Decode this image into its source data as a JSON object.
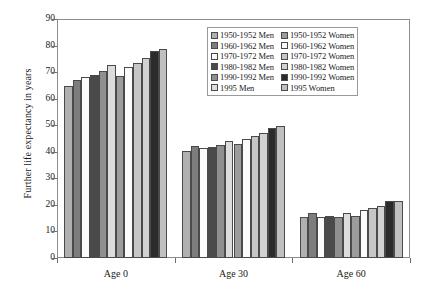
{
  "chart_data": {
    "type": "bar",
    "title": "",
    "subtitle": "",
    "xlabel": "",
    "ylabel": "Further life expectancy in years",
    "categories": [
      "Age 0",
      "Age 30",
      "Age 60"
    ],
    "ylim": [
      0,
      90
    ],
    "ytick_values": [
      0,
      10,
      20,
      30,
      40,
      50,
      60,
      70,
      80,
      90
    ],
    "ytick_labels": [
      "0",
      "10",
      "20",
      "30",
      "40",
      "50",
      "60",
      "70",
      "80",
      "90"
    ],
    "grid": false,
    "legend_position": "top-right inside plot",
    "series": [
      {
        "name": "1950-1952 Men",
        "color": "#b0b0b0",
        "values": [
          64.6,
          40.2,
          15.5
        ]
      },
      {
        "name": "1960-1962 Men",
        "color": "#7d7d7d",
        "values": [
          67.2,
          42.2,
          16.9
        ]
      },
      {
        "name": "1970-1972 Men",
        "color": "#fbfbfb",
        "values": [
          68.2,
          41.6,
          15.6
        ]
      },
      {
        "name": "1980-1982 Men",
        "color": "#4a4a4a",
        "values": [
          69.0,
          41.7,
          15.9
        ]
      },
      {
        "name": "1990-1992 Men",
        "color": "#8f8f8f",
        "values": [
          70.3,
          42.4,
          15.6
        ]
      },
      {
        "name": "1995 Men",
        "color": "#dcdcdc",
        "values": [
          72.5,
          44.0,
          17.1
        ]
      },
      {
        "name": "1950-1952 Women",
        "color": "#9c9c9c",
        "values": [
          68.5,
          42.9,
          16.0
        ]
      },
      {
        "name": "1960-1962 Women",
        "color": "#fbfbfb",
        "values": [
          71.8,
          44.7,
          18.2
        ]
      },
      {
        "name": "1970-1972 Women",
        "color": "#c6c6c6",
        "values": [
          73.6,
          45.8,
          18.8
        ]
      },
      {
        "name": "1980-1982 Women",
        "color": "#d2d2d2",
        "values": [
          75.3,
          46.9,
          19.5
        ]
      },
      {
        "name": "1990-1992 Women",
        "color": "#2b2b2b",
        "values": [
          77.9,
          49.0,
          21.3
        ]
      },
      {
        "name": "1995 Women",
        "color": "#c0c0c0",
        "values": [
          78.6,
          49.6,
          21.5
        ]
      }
    ],
    "legend_columns": [
      [
        "1950-1952 Men",
        "1960-1962 Men",
        "1970-1972 Men",
        "1980-1982 Men",
        "1990-1992 Men",
        "1995 Men"
      ],
      [
        "1950-1952 Women",
        "1960-1962 Women",
        "1970-1972 Women",
        "1980-1982 Women",
        "1990-1992 Women",
        "1995 Women"
      ]
    ]
  }
}
